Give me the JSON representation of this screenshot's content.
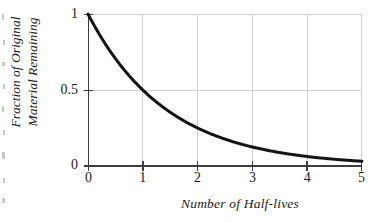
{
  "chart_data": {
    "type": "line",
    "title": "",
    "xlabel": "Number of Half-lives",
    "ylabel": "Fraction of Original Material Remaining",
    "ylabel_line1": "Fraction of Original",
    "ylabel_line2": "Material Remaining",
    "xlim": [
      0,
      5
    ],
    "ylim": [
      0,
      1
    ],
    "xticks": [
      "0",
      "1",
      "2",
      "3",
      "4",
      "5"
    ],
    "xtick_values": [
      0,
      1,
      2,
      3,
      4,
      5
    ],
    "yticks": [
      "0",
      "0.5",
      "1"
    ],
    "ytick_values": [
      0,
      0.5,
      1
    ],
    "grid": true,
    "legend": "none",
    "series": [
      {
        "name": "Fraction remaining",
        "equation": "y = 0.5^x",
        "color": "#141414",
        "line_width": 3,
        "x": [
          0,
          0.25,
          0.5,
          0.75,
          1,
          1.25,
          1.5,
          1.75,
          2,
          2.25,
          2.5,
          2.75,
          3,
          3.25,
          3.5,
          3.75,
          4,
          4.25,
          4.5,
          4.75,
          5
        ],
        "y": [
          1,
          0.841,
          0.707,
          0.595,
          0.5,
          0.42,
          0.354,
          0.297,
          0.25,
          0.21,
          0.177,
          0.149,
          0.125,
          0.105,
          0.088,
          0.074,
          0.0625,
          0.053,
          0.044,
          0.037,
          0.031
        ]
      }
    ],
    "key_points": [
      {
        "x": 0,
        "y": 1
      },
      {
        "x": 1,
        "y": 0.5
      },
      {
        "x": 2,
        "y": 0.25
      },
      {
        "x": 3,
        "y": 0.125
      },
      {
        "x": 4,
        "y": 0.0625
      },
      {
        "x": 5,
        "y": 0.031
      }
    ]
  },
  "style": {
    "axis_color": "#3d3d3d",
    "grid_color": "#d0d0d0",
    "curve_color": "#141414",
    "background": "#ffffff",
    "text_color": "#1a1a1a"
  },
  "geometry": {
    "plot_left": 88,
    "plot_right": 362,
    "plot_top": 14,
    "plot_bottom": 166
  }
}
